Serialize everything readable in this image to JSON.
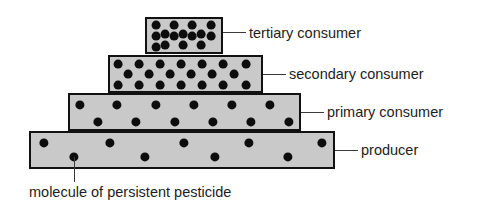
{
  "figure": {
    "caption": "molecule of persistent pesticide",
    "background_color": "#ffffff",
    "box_fill_color": "#c9c9c9",
    "box_border_color": "#111111",
    "dot_color": "#0d0d0d",
    "leader_color": "#3a3a3a",
    "text_color": "#1d1d1d"
  },
  "levels": [
    {
      "id": "tertiary-consumer",
      "label": "tertiary consumer",
      "trophic_rank": 4,
      "box": {
        "x": 145,
        "y": 17,
        "width": 78,
        "height": 37
      },
      "dot_count": 15,
      "dot_radius": 4.4,
      "dot_density": "highest",
      "dots": [
        {
          "x": 156,
          "y": 25
        },
        {
          "x": 174,
          "y": 25
        },
        {
          "x": 192,
          "y": 25
        },
        {
          "x": 211,
          "y": 25
        },
        {
          "x": 165,
          "y": 34
        },
        {
          "x": 183,
          "y": 34
        },
        {
          "x": 201,
          "y": 34
        },
        {
          "x": 156,
          "y": 36
        },
        {
          "x": 174,
          "y": 36
        },
        {
          "x": 192,
          "y": 36
        },
        {
          "x": 211,
          "y": 36
        },
        {
          "x": 165,
          "y": 45
        },
        {
          "x": 183,
          "y": 45
        },
        {
          "x": 201,
          "y": 45
        },
        {
          "x": 156,
          "y": 47
        }
      ],
      "leader": {
        "x1": 223,
        "x2": 246,
        "y": 32
      },
      "label_pos": {
        "x": 249,
        "y": 26
      }
    },
    {
      "id": "secondary-consumer",
      "label": "secondary consumer",
      "trophic_rank": 3,
      "box": {
        "x": 108,
        "y": 55,
        "width": 155,
        "height": 38
      },
      "dot_count": 20,
      "dot_radius": 4.4,
      "dot_density": "high",
      "dots": [
        {
          "x": 118,
          "y": 64
        },
        {
          "x": 139,
          "y": 64
        },
        {
          "x": 160,
          "y": 64
        },
        {
          "x": 181,
          "y": 64
        },
        {
          "x": 202,
          "y": 64
        },
        {
          "x": 223,
          "y": 64
        },
        {
          "x": 246,
          "y": 64
        },
        {
          "x": 128,
          "y": 74
        },
        {
          "x": 149,
          "y": 74
        },
        {
          "x": 170,
          "y": 74
        },
        {
          "x": 191,
          "y": 74
        },
        {
          "x": 212,
          "y": 74
        },
        {
          "x": 234,
          "y": 74
        },
        {
          "x": 118,
          "y": 85
        },
        {
          "x": 139,
          "y": 85
        },
        {
          "x": 160,
          "y": 85
        },
        {
          "x": 181,
          "y": 85
        },
        {
          "x": 202,
          "y": 85
        },
        {
          "x": 223,
          "y": 85
        },
        {
          "x": 246,
          "y": 85
        }
      ],
      "leader": {
        "x1": 263,
        "x2": 286,
        "y": 74
      },
      "label_pos": {
        "x": 289,
        "y": 67
      }
    },
    {
      "id": "primary-consumer",
      "label": "primary consumer",
      "trophic_rank": 2,
      "box": {
        "x": 68,
        "y": 93,
        "width": 233,
        "height": 38
      },
      "dot_count": 12,
      "dot_radius": 4.6,
      "dot_density": "medium",
      "dots": [
        {
          "x": 80,
          "y": 105
        },
        {
          "x": 117,
          "y": 105
        },
        {
          "x": 156,
          "y": 105
        },
        {
          "x": 194,
          "y": 105
        },
        {
          "x": 232,
          "y": 105
        },
        {
          "x": 270,
          "y": 105
        },
        {
          "x": 98,
          "y": 122
        },
        {
          "x": 136,
          "y": 122
        },
        {
          "x": 175,
          "y": 122
        },
        {
          "x": 213,
          "y": 122
        },
        {
          "x": 251,
          "y": 122
        },
        {
          "x": 289,
          "y": 122
        }
      ],
      "leader": {
        "x1": 301,
        "x2": 324,
        "y": 112
      },
      "label_pos": {
        "x": 327,
        "y": 105
      }
    },
    {
      "id": "producer",
      "label": "producer",
      "trophic_rank": 1,
      "box": {
        "x": 29,
        "y": 131,
        "width": 306,
        "height": 38
      },
      "dot_count": 9,
      "dot_radius": 4.6,
      "dot_density": "lowest",
      "dots": [
        {
          "x": 44,
          "y": 143
        },
        {
          "x": 110,
          "y": 143
        },
        {
          "x": 184,
          "y": 143
        },
        {
          "x": 249,
          "y": 143
        },
        {
          "x": 322,
          "y": 143
        },
        {
          "x": 74,
          "y": 157
        },
        {
          "x": 145,
          "y": 157
        },
        {
          "x": 215,
          "y": 157
        },
        {
          "x": 288,
          "y": 157
        }
      ],
      "leader": {
        "x1": 335,
        "x2": 358,
        "y": 150
      },
      "label_pos": {
        "x": 361,
        "y": 143
      }
    }
  ],
  "caption_leader": {
    "x": 74,
    "y1": 157,
    "y2": 182
  },
  "caption_pos": {
    "x": 29,
    "y": 185
  }
}
